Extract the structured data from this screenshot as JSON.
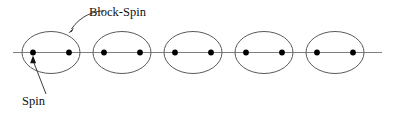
{
  "figure": {
    "width": 395,
    "height": 114,
    "background_color": "#ffffff"
  },
  "colors": {
    "axis": "#808080",
    "ellipse_stroke": "#5a5a5a",
    "dot_fill": "#000000",
    "leader": "#3d3d3d",
    "text": "#111111"
  },
  "axis": {
    "name": "spin-chain-axis",
    "x1": 13,
    "y1": 52.5,
    "x2": 382,
    "y2": 52.5
  },
  "geometry": {
    "ellipse_rx": 29,
    "ellipse_ry": 21,
    "dot_radius": 2.9,
    "dot_offset": 18,
    "center_y": 52.5
  },
  "blocks": [
    {
      "name": "block-spin-1",
      "cx": 51,
      "dots": [
        33,
        69
      ]
    },
    {
      "name": "block-spin-2",
      "cx": 122,
      "dots": [
        104,
        140
      ]
    },
    {
      "name": "block-spin-3",
      "cx": 193,
      "dots": [
        175,
        211
      ]
    },
    {
      "name": "block-spin-4",
      "cx": 264,
      "dots": [
        246,
        282
      ]
    },
    {
      "name": "block-spin-5",
      "cx": 335,
      "dots": [
        317,
        353
      ]
    }
  ],
  "annotations": {
    "block_spin": {
      "label": "Block-Spin",
      "text_x": 89,
      "text_y": 16,
      "leader_path": "M 104 11 C 95 10.5 80 16 71.5 29",
      "arrow_points": "68.3,33.2 73.2,27.6 72.4,31.1"
    },
    "spin": {
      "label": "Spin",
      "text_x": 22,
      "text_y": 105,
      "leader_path": "M 46 94 L 33.6 62",
      "arrow_points": "33.0,55.6 36.2,63.0 30.2,63.0"
    }
  }
}
